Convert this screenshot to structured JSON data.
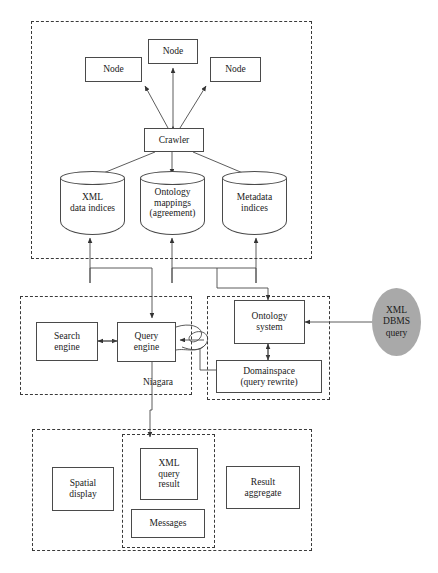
{
  "diagram": {
    "colors": {
      "stroke": "#4a4a4a",
      "dashed_border": "#3a3a3a",
      "ellipse_fill": "#a9a9a9",
      "background": "#ffffff"
    },
    "crawler_layer": {
      "nodes": [
        {
          "label": "Node"
        },
        {
          "label": "Node"
        },
        {
          "label": "Node"
        }
      ],
      "crawler": {
        "label": "Crawler"
      },
      "stores": [
        {
          "label": "XML\ndata indices"
        },
        {
          "label": "Ontology\nmappings\n(agreement)"
        },
        {
          "label": "Metadata\nindices"
        }
      ]
    },
    "niagara_layer": {
      "group_label": "Niagara",
      "boxes": [
        {
          "label": "Search\nengine"
        },
        {
          "label": "Query\nengine"
        }
      ]
    },
    "ontology_layer": {
      "boxes": [
        {
          "label": "Ontology\nsystem"
        },
        {
          "label": "Domainspace\n(query rewrite)"
        }
      ]
    },
    "external": {
      "source": {
        "label": "XML\nDBMS\nquery"
      }
    },
    "presentation_layer": {
      "boxes": [
        {
          "label": "Spatial\ndisplay"
        },
        {
          "label": "Result\naggregate"
        }
      ],
      "inner_boxes": [
        {
          "label": "XML\nquery\nresult"
        },
        {
          "label": "Messages"
        }
      ]
    }
  }
}
